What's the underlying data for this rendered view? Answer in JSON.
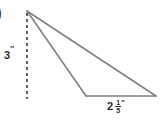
{
  "figure": {
    "type": "geometry-diagram",
    "shape": "obtuse-triangle",
    "background_color": "#fefefe",
    "stroke_color": "#808080",
    "text_color": "#2b2b2b",
    "problem_marker": ")",
    "height_label": {
      "value": "3",
      "unit_mark": "″",
      "meaning": "3 inches",
      "orientation": "vertical-dashed-height"
    },
    "base_label": {
      "whole": "2",
      "numerator": "1",
      "denominator": "5",
      "unit_mark": "″",
      "meaning": "2 1/5 inches",
      "orientation": "horizontal-base"
    },
    "geometry": {
      "apex": [
        27,
        11
      ],
      "base_left": [
        86,
        96
      ],
      "base_right": [
        156,
        96
      ],
      "dashed_line_from": [
        27,
        13
      ],
      "dashed_line_to": [
        27,
        99
      ],
      "dash_pattern": "3,3"
    }
  }
}
